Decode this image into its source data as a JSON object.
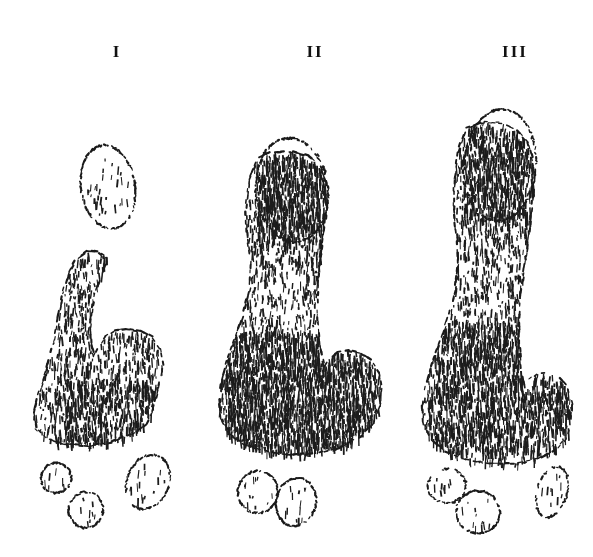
{
  "plate": {
    "width": 593,
    "height": 557,
    "background_color": "#ffffff",
    "ink_color": "#111111",
    "medium": "pen-and-ink hatched line drawing",
    "caption": "",
    "figure_count": 3
  },
  "labels": [
    {
      "text": "I",
      "x": 117,
      "y": 55,
      "name": "figure-label-i"
    },
    {
      "text": "II",
      "x": 315,
      "y": 55,
      "name": "figure-label-ii"
    },
    {
      "text": "III",
      "x": 515,
      "y": 55,
      "name": "figure-label-iii"
    }
  ],
  "specimens": [
    {
      "id": "i",
      "label": "I",
      "description": "smallest stage; detached ovoid apical lobe above a narrow clavate body with a broad hatched base and three separate basal nodules",
      "seed": 1147,
      "apex_detached": true,
      "apex": {
        "cx": 108,
        "cy": 187,
        "rx": 27,
        "ry": 42,
        "rotate": -8
      },
      "body": {
        "points": "77,258 69,272 63,292 58,318 53,345 46,372 38,396 34,414 36,428 46,438 64,444 88,446 112,442 132,434 146,424 152,412 156,398 160,382 163,364 160,348 152,337 140,331 126,329 114,331 105,337 99,346 94,356 91,345 90,327 92,308 96,290 101,276 106,265 106,258 98,252 87,251",
        "hatch_zone": {
          "x": 66,
          "y": 378,
          "w": 88,
          "h": 62
        },
        "hatch_density": 0.52,
        "hatch_angle": 82
      },
      "nodules": [
        {
          "cx": 56,
          "cy": 478,
          "rx": 15,
          "ry": 15,
          "rotate": 0
        },
        {
          "cx": 86,
          "cy": 510,
          "rx": 17,
          "ry": 18,
          "rotate": 10
        },
        {
          "cx": 148,
          "cy": 482,
          "rx": 21,
          "ry": 28,
          "rotate": 22
        }
      ]
    },
    {
      "id": "ii",
      "label": "II",
      "description": "intermediate stage; continuous elongate clavate body with strongly hatched apex and a very dense vertically striated swollen base, two basal nodules",
      "seed": 2291,
      "apex_detached": false,
      "apex": {
        "cx": 292,
        "cy": 190,
        "rx": 36,
        "ry": 52,
        "rotate": -6
      },
      "body": {
        "points": "258,158 249,180 246,208 247,236 251,262 250,288 244,312 236,336 228,358 222,380 219,400 221,418 230,434 246,445 268,452 294,455 320,453 344,446 362,436 374,422 380,406 382,388 379,372 371,360 360,353 348,350 337,352 329,358 324,366 320,348 318,324 317,298 319,272 322,246 325,222 327,200 326,182 320,166 308,156 288,151 270,152",
        "hatch_zone": {
          "x": 224,
          "y": 330,
          "w": 152,
          "h": 118
        },
        "hatch_density": 0.92,
        "hatch_angle": 86
      },
      "nodules": [
        {
          "cx": 258,
          "cy": 492,
          "rx": 20,
          "ry": 21,
          "rotate": 0
        },
        {
          "cx": 296,
          "cy": 502,
          "rx": 20,
          "ry": 24,
          "rotate": 14
        }
      ]
    },
    {
      "id": "iii",
      "label": "III",
      "description": "largest stage; tallest body reaching highest on the plate with fine vertical striations throughout, broad hatched base, three basal nodules and a detached fragment at right",
      "seed": 3377,
      "apex_detached": false,
      "apex": {
        "cx": 500,
        "cy": 165,
        "rx": 36,
        "ry": 56,
        "rotate": 4
      },
      "body": {
        "points": "466,128 458,152 454,180 454,210 457,238 458,264 455,290 449,314 441,338 433,360 426,382 422,402 423,422 431,440 446,452 466,460 490,464 514,464 538,459 556,450 566,438 571,422 572,404 568,388 559,378 548,373 537,374 529,380 524,388 521,368 519,344 519,318 521,292 525,264 529,236 532,208 534,182 533,160 528,142 517,130 502,123 484,122",
        "hatch_zone": {
          "x": 428,
          "y": 320,
          "w": 148,
          "h": 130
        },
        "hatch_density": 0.78,
        "hatch_angle": 84
      },
      "nodules": [
        {
          "cx": 447,
          "cy": 486,
          "rx": 19,
          "ry": 17,
          "rotate": -6
        },
        {
          "cx": 478,
          "cy": 512,
          "rx": 22,
          "ry": 21,
          "rotate": 8
        },
        {
          "cx": 552,
          "cy": 492,
          "rx": 15,
          "ry": 26,
          "rotate": 16
        }
      ]
    }
  ]
}
